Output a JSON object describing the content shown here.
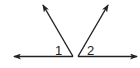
{
  "diagram": {
    "colors": {
      "stroke": "#222222",
      "background": "#ffffff"
    },
    "angles": [
      {
        "label": "1",
        "vertex": [
          73,
          56
        ],
        "rays": [
          [
            14,
            56
          ],
          [
            43,
            5
          ]
        ]
      },
      {
        "label": "2",
        "vertex": [
          78,
          56
        ],
        "rays": [
          [
            137,
            56
          ],
          [
            108,
            5
          ]
        ]
      }
    ]
  }
}
